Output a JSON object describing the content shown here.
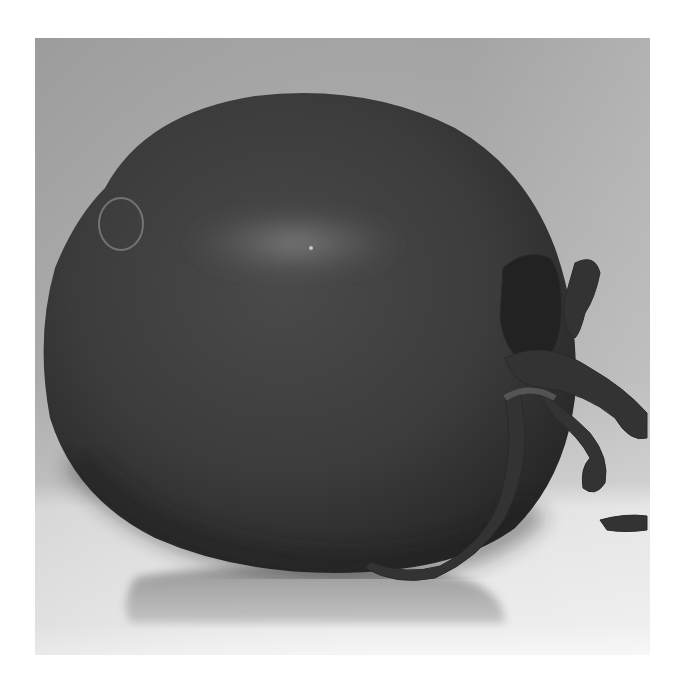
{
  "image": {
    "subject": "tomato",
    "style": "grayscale photograph",
    "description": "Close-up of a single tomato lying on its side on a reflective surface, stem and sepals on the right",
    "colors": {
      "page_background": "#ffffff",
      "backdrop": "#a6a6a6",
      "backdrop_light": "#bdbdbd",
      "surface": "#d9d9d9",
      "surface_light": "#efefef",
      "tomato_dark": "#2e2e2e",
      "tomato_mid": "#444444",
      "highlight": "#7a7a7a",
      "stem": "#3a3a3a",
      "reflection": "#9c9c9c"
    }
  }
}
